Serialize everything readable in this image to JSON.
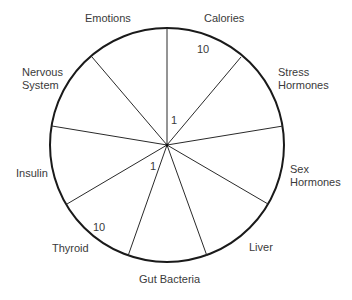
{
  "diagram": {
    "type": "wheel",
    "segments": [
      {
        "label_line1": "Calories",
        "label_line2": ""
      },
      {
        "label_line1": "Stress",
        "label_line2": "Hormones"
      },
      {
        "label_line1": "Sex",
        "label_line2": "Hormones"
      },
      {
        "label_line1": "Liver",
        "label_line2": ""
      },
      {
        "label_line1": "Gut Bacteria",
        "label_line2": ""
      },
      {
        "label_line1": "Thyroid",
        "label_line2": ""
      },
      {
        "label_line1": "Insulin",
        "label_line2": ""
      },
      {
        "label_line1": "Nervous",
        "label_line2": "System"
      },
      {
        "label_line1": "Emotions",
        "label_line2": ""
      }
    ],
    "scale": {
      "inner_1": "1",
      "outer_10": "10",
      "inner_1b": "1",
      "outer_10b": "10"
    },
    "colors": {
      "stroke": "#1a1a1a",
      "text": "#3a3a3a",
      "background": "#ffffff"
    }
  }
}
